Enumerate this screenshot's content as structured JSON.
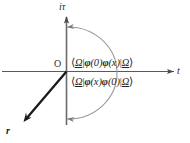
{
  "figure": {
    "name": "complex-time-plane-contour",
    "background_color": "#ffffff",
    "axes": {
      "horizontal_label": "t",
      "vertical_label": "iτ",
      "origin_label": "O",
      "axis_color": "#555555"
    },
    "vector": {
      "label": "r",
      "color": "#1a1a1a",
      "direction": "down-left"
    },
    "contour": {
      "name": "wick-rotation-arc",
      "color": "#8a8a8a",
      "arrowheads": [
        "top-end-pointing-left",
        "bottom-end-pointing-left"
      ]
    },
    "formulas": {
      "upper": {
        "bra": "⟨",
        "omega_left": "Ω",
        "bar1": "|",
        "phi1": "φ",
        "arg1": "(0)",
        "phi2": "φ",
        "arg2": "(x)",
        "bar2": "|",
        "omega_right": "Ω",
        "ket": "⟩",
        "plain": "⟨Ω|φ(0)φ(x)|Ω⟩"
      },
      "lower": {
        "bra": "⟨",
        "omega_left": "Ω",
        "bar1": "|",
        "phi1": "φ",
        "arg1": "(x)",
        "phi2": "φ",
        "arg2": "(0)",
        "bar2": "|",
        "omega_right": "Ω",
        "ket": "⟩",
        "plain": "⟨Ω|φ(x)φ(0)|Ω⟩"
      }
    }
  }
}
